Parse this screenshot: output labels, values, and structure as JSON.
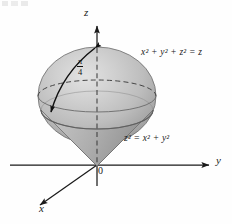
{
  "figure": {
    "type": "3d-solid-geometry-diagram",
    "axes": {
      "z_label": "z",
      "y_label": "y",
      "x_label": "x",
      "origin_label": "0"
    },
    "annotations": {
      "angle_numerator": "π",
      "angle_denominator": "4"
    },
    "equations": {
      "sphere": "x² + y² + z² = z",
      "cone": "z² = x² + y²"
    },
    "colors": {
      "ink": "#1a1a1a",
      "surface_light": "#d8d8d8",
      "surface_mid": "#b4b4b4",
      "surface_dark": "#8a8a8a",
      "background": "#ffffff"
    }
  }
}
